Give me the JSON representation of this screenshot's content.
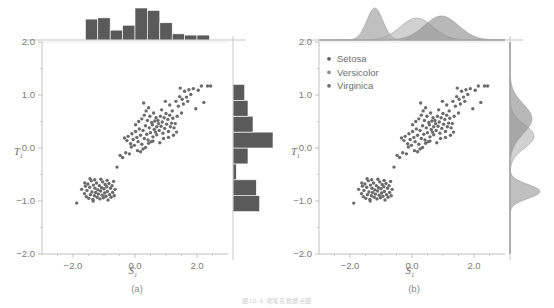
{
  "figure": {
    "caption": "图10-9  鸢尾花数据点图",
    "panels": [
      {
        "key": "a",
        "label": "(a)",
        "marginal_style": "histogram",
        "has_legend": false
      },
      {
        "key": "b",
        "label": "(b)",
        "marginal_style": "kde",
        "has_legend": true
      }
    ]
  },
  "legend": {
    "items": [
      {
        "label": "Setosa",
        "color": "#5f5f5f"
      },
      {
        "label": "Versicolor",
        "color": "#8e8e8e"
      },
      {
        "label": "Virginica",
        "color": "#6e6e6e"
      }
    ]
  },
  "axes": {
    "xlabel": "S",
    "xlabel_sub": "1",
    "ylabel": "T",
    "ylabel_sub": "1",
    "xlim": [
      -3.0,
      3.0
    ],
    "ylim": [
      -2.0,
      2.0
    ],
    "xticks": [
      -2.0,
      0.0,
      2.0
    ],
    "xtick_labels": [
      "-2.0",
      "0.0",
      "2.0"
    ],
    "yticks": [
      2.0,
      1.0,
      0.0,
      -1.0,
      -2.0
    ],
    "ytick_labels": [
      "2.0",
      "1.0",
      "0.0",
      "-1.0",
      "-2.0"
    ],
    "xminor": [
      -2.5,
      -1.5,
      -1.0,
      -0.5,
      0.5,
      1.0,
      1.5,
      2.5
    ],
    "yminor": [
      1.5,
      0.5,
      -0.5,
      -1.5
    ],
    "grid": false
  },
  "colors": {
    "point": "#6b6b6b",
    "hist_fill": "#5a5a5a",
    "axis": "#b9b9b9",
    "text": "#6f6f6f",
    "kde_setosa": "#9a9a9a",
    "kde_versicolor": "#b4b4b4",
    "kde_virginica": "#8c8c8c"
  },
  "chart_data": {
    "type": "scatter",
    "title": "",
    "xlabel": "S1",
    "ylabel": "T1",
    "xlim": [
      -3.0,
      3.0
    ],
    "ylim": [
      -2.0,
      2.0
    ],
    "grid": false,
    "legend_position": "upper-left (panel b only)",
    "series": [
      {
        "name": "Setosa",
        "color": "#5f5f5f",
        "points": [
          [
            -1.88,
            -1.04
          ],
          [
            -1.72,
            -0.78
          ],
          [
            -1.63,
            -0.86
          ],
          [
            -1.6,
            -0.72
          ],
          [
            -1.57,
            -0.92
          ],
          [
            -1.55,
            -0.8
          ],
          [
            -1.52,
            -0.68
          ],
          [
            -1.49,
            -0.95
          ],
          [
            -1.46,
            -0.74
          ],
          [
            -1.44,
            -0.88
          ],
          [
            -1.41,
            -0.62
          ],
          [
            -1.39,
            -0.83
          ],
          [
            -1.36,
            -0.97
          ],
          [
            -1.34,
            -0.7
          ],
          [
            -1.31,
            -0.9
          ],
          [
            -1.29,
            -0.76
          ],
          [
            -1.27,
            -0.84
          ],
          [
            -1.24,
            -0.66
          ],
          [
            -1.22,
            -0.93
          ],
          [
            -1.2,
            -0.79
          ],
          [
            -1.18,
            -0.87
          ],
          [
            -1.15,
            -0.71
          ],
          [
            -1.13,
            -0.96
          ],
          [
            -1.11,
            -0.81
          ],
          [
            -1.08,
            -0.75
          ],
          [
            -1.06,
            -0.89
          ],
          [
            -1.04,
            -0.64
          ],
          [
            -1.02,
            -0.94
          ],
          [
            -1.0,
            -0.77
          ],
          [
            -0.98,
            -0.85
          ],
          [
            -0.96,
            -0.69
          ],
          [
            -0.94,
            -0.91
          ],
          [
            -0.91,
            -0.73
          ],
          [
            -0.89,
            -0.82
          ],
          [
            -0.87,
            -0.98
          ],
          [
            -0.84,
            -0.67
          ],
          [
            -0.82,
            -0.88
          ],
          [
            -0.79,
            -0.76
          ],
          [
            -0.77,
            -0.93
          ],
          [
            -0.74,
            -0.71
          ],
          [
            -0.72,
            -0.84
          ],
          [
            -0.69,
            -0.63
          ],
          [
            -0.67,
            -0.9
          ],
          [
            -0.64,
            -0.78
          ],
          [
            -1.45,
            -0.58
          ],
          [
            -1.3,
            -0.6
          ],
          [
            -1.1,
            -0.59
          ],
          [
            -0.9,
            -0.61
          ],
          [
            -1.62,
            -0.66
          ],
          [
            -1.35,
            -1.0
          ]
        ]
      },
      {
        "name": "Versicolor",
        "color": "#8e8e8e",
        "points": [
          [
            -0.58,
            -0.36
          ],
          [
            -0.48,
            -0.14
          ],
          [
            -0.4,
            -0.18
          ],
          [
            -0.34,
            0.19
          ],
          [
            -0.3,
            -0.09
          ],
          [
            -0.26,
            0.14
          ],
          [
            -0.22,
            0.22
          ],
          [
            -0.18,
            -0.11
          ],
          [
            -0.14,
            0.08
          ],
          [
            -0.1,
            0.27
          ],
          [
            -0.06,
            0.16
          ],
          [
            -0.02,
            0.05
          ],
          [
            0.02,
            0.31
          ],
          [
            0.06,
            0.2
          ],
          [
            0.1,
            0.12
          ],
          [
            0.14,
            0.36
          ],
          [
            0.18,
            0.24
          ],
          [
            0.22,
            0.07
          ],
          [
            0.26,
            0.33
          ],
          [
            0.3,
            0.18
          ],
          [
            0.34,
            0.42
          ],
          [
            0.38,
            0.26
          ],
          [
            0.42,
            0.15
          ],
          [
            0.46,
            0.38
          ],
          [
            0.5,
            0.29
          ],
          [
            0.54,
            0.48
          ],
          [
            0.58,
            0.21
          ],
          [
            0.62,
            0.35
          ],
          [
            0.18,
            -0.07
          ],
          [
            0.26,
            -0.02
          ],
          [
            0.34,
            0.01
          ],
          [
            0.08,
            -0.05
          ],
          [
            -0.12,
            0.02
          ],
          [
            0.44,
            0.09
          ],
          [
            0.52,
            0.12
          ],
          [
            0.02,
            0.44
          ],
          [
            0.22,
            0.55
          ],
          [
            0.3,
            0.62
          ],
          [
            0.4,
            0.52
          ],
          [
            0.12,
            0.5
          ],
          [
            0.48,
            0.6
          ],
          [
            0.56,
            0.44
          ],
          [
            0.64,
            0.51
          ],
          [
            0.36,
            0.7
          ],
          [
            0.44,
            0.76
          ],
          [
            0.7,
            0.4
          ],
          [
            0.76,
            0.46
          ],
          [
            0.68,
            0.57
          ],
          [
            0.6,
            0.66
          ],
          [
            0.28,
            0.85
          ]
        ]
      },
      {
        "name": "Virginica",
        "color": "#6e6e6e",
        "points": [
          [
            0.7,
            0.25
          ],
          [
            0.78,
            0.33
          ],
          [
            0.84,
            0.41
          ],
          [
            0.9,
            0.28
          ],
          [
            0.96,
            0.37
          ],
          [
            1.02,
            0.45
          ],
          [
            1.08,
            0.31
          ],
          [
            1.14,
            0.4
          ],
          [
            0.74,
            0.52
          ],
          [
            0.82,
            0.6
          ],
          [
            0.88,
            0.49
          ],
          [
            0.94,
            0.57
          ],
          [
            1.0,
            0.65
          ],
          [
            1.06,
            0.54
          ],
          [
            1.12,
            0.62
          ],
          [
            1.18,
            0.47
          ],
          [
            1.22,
            0.56
          ],
          [
            1.26,
            0.38
          ],
          [
            1.3,
            0.46
          ],
          [
            1.34,
            0.3
          ],
          [
            1.4,
            0.79
          ],
          [
            1.46,
            1.13
          ],
          [
            1.52,
            0.92
          ],
          [
            1.6,
            1.07
          ],
          [
            1.66,
            0.96
          ],
          [
            1.74,
            1.1
          ],
          [
            1.8,
            1.01
          ],
          [
            1.88,
            1.12
          ],
          [
            1.96,
            0.74
          ],
          [
            2.04,
            1.09
          ],
          [
            2.14,
            1.17
          ],
          [
            2.22,
            0.86
          ],
          [
            2.34,
            1.17
          ],
          [
            2.44,
            1.17
          ],
          [
            1.32,
            0.88
          ],
          [
            1.44,
            0.97
          ],
          [
            1.12,
            0.81
          ],
          [
            0.98,
            0.88
          ],
          [
            0.86,
            0.72
          ],
          [
            1.2,
            0.7
          ],
          [
            1.56,
            0.83
          ],
          [
            1.7,
            0.88
          ],
          [
            0.66,
            0.3
          ],
          [
            0.58,
            0.13
          ],
          [
            1.08,
            0.2
          ],
          [
            0.92,
            0.18
          ],
          [
            0.8,
            0.1
          ],
          [
            1.24,
            0.24
          ],
          [
            1.36,
            0.6
          ],
          [
            1.5,
            0.66
          ]
        ]
      }
    ],
    "marginal_x_histogram": {
      "description": "Top marginal histogram of S1 (panel a)",
      "bin_edges": [
        -2.0,
        -1.6,
        -1.2,
        -0.8,
        -0.4,
        0.0,
        0.4,
        0.8,
        1.2,
        1.6,
        2.0,
        2.4,
        2.8
      ],
      "counts": [
        0,
        17,
        18,
        8,
        12,
        26,
        24,
        14,
        5,
        4,
        4,
        0
      ]
    },
    "marginal_y_histogram": {
      "description": "Right marginal histogram of T1 (panel a)",
      "bin_edges": [
        -1.2,
        -0.9,
        -0.6,
        -0.3,
        0.0,
        0.3,
        0.6,
        0.9,
        1.2
      ],
      "counts": [
        16,
        14,
        2,
        9,
        24,
        12,
        9,
        7
      ]
    },
    "marginal_x_kde": {
      "description": "Top marginal KDE of S1 by species (panel b)",
      "series": [
        "Setosa",
        "Versicolor",
        "Virginica"
      ],
      "peaks": [
        -1.2,
        0.15,
        0.95
      ]
    },
    "marginal_y_kde": {
      "description": "Right marginal KDE of T1 by species (panel b)",
      "series": [
        "Setosa",
        "Versicolor",
        "Virginica"
      ],
      "peaks": [
        -0.82,
        0.22,
        0.55
      ]
    }
  }
}
